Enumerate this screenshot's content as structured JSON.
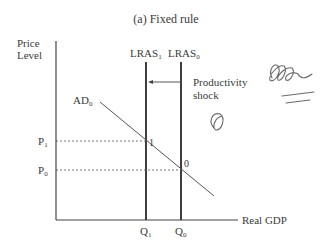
{
  "title": "(a) Fixed rule",
  "y_axis": {
    "label_line1": "Price",
    "label_line2": "Level"
  },
  "x_axis": {
    "label": "Real GDP"
  },
  "curves": {
    "lras1": {
      "label": "LRAS",
      "sub": "1"
    },
    "lras0": {
      "label": "LRAS",
      "sub": "0"
    },
    "ad0": {
      "label": "AD",
      "sub": "0"
    }
  },
  "annotation": {
    "line1": "Productivity",
    "line2": "shock"
  },
  "price_ticks": [
    {
      "label": "P",
      "sub": "1"
    },
    {
      "label": "P",
      "sub": "0"
    }
  ],
  "quantity_ticks": [
    {
      "label": "Q",
      "sub": "1"
    },
    {
      "label": "Q",
      "sub": "0"
    }
  ],
  "points": [
    {
      "label": "1"
    },
    {
      "label": "0"
    }
  ],
  "handwriting": {
    "description": "pencil scribbles"
  }
}
